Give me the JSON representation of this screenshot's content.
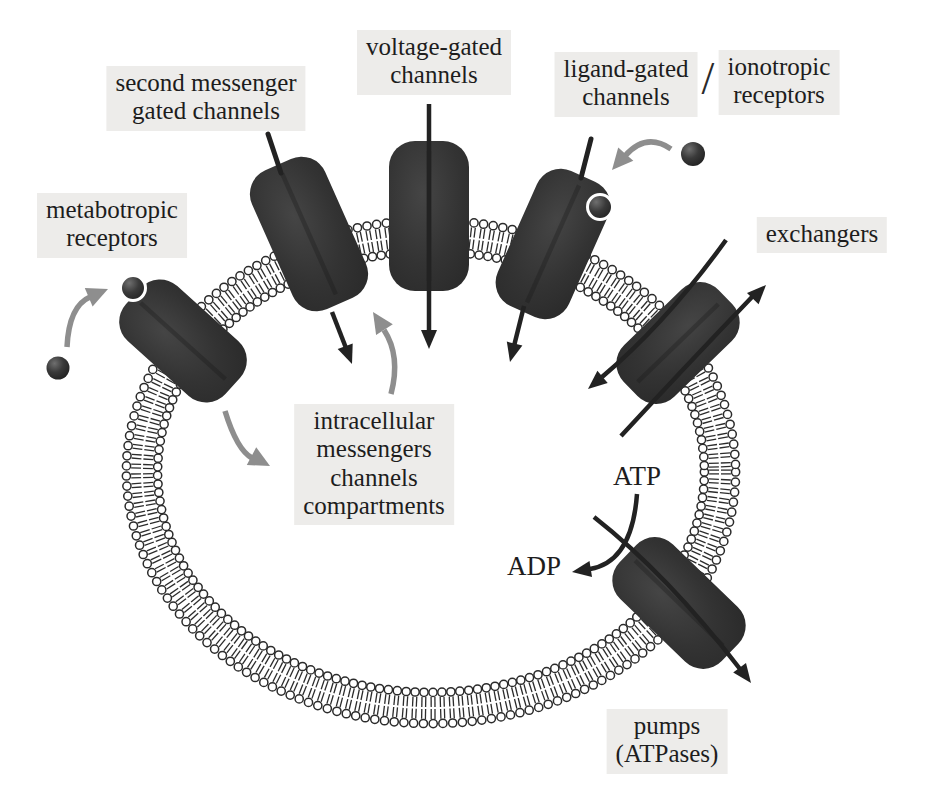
{
  "diagram": {
    "membrane": "phospholipid bilayer closed loop (cell)",
    "proteins": [
      "metabotropic receptors",
      "second messenger gated channels",
      "voltage-gated channels",
      "ligand-gated channels / ionotropic receptors",
      "exchangers",
      "pumps (ATPases)"
    ],
    "molecules": [
      "ligand (filled sphere)",
      "ATP",
      "ADP"
    ]
  },
  "labels": {
    "metabotropic": "metabotropic\nreceptors",
    "second_messenger": "second messenger\ngated channels",
    "voltage_gated": "voltage-gated\nchannels",
    "ligand_gated": "ligand-gated\nchannels",
    "slash": "/",
    "ionotropic": "ionotropic\nreceptors",
    "exchangers": "exchangers",
    "intracellular": "intracellular\nmessengers\nchannels\ncompartments",
    "atp": "ATP",
    "adp": "ADP",
    "pumps": "pumps\n(ATPases)"
  },
  "colors": {
    "background": "#ffffff",
    "channel_fill": "#333333",
    "channel_edge": "#2a2a2a",
    "membrane_stroke": "#2b2b2b",
    "lipid_head_fill": "#ffffff",
    "arrow_dark": "#222222",
    "arrow_gray": "#8e8e8e",
    "ball_dark": "#1c1c1c",
    "ball_highlight": "#6f6f6f",
    "label_background": "#edecea",
    "text": "#1d1d1d"
  }
}
